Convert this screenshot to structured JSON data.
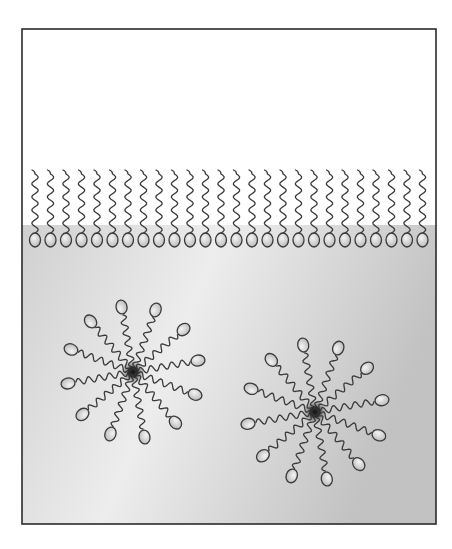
{
  "diagram": {
    "frame": {
      "x": 22,
      "y": 29,
      "width": 414,
      "height": 495,
      "stroke": "#2b2b2b"
    },
    "regions": {
      "air": {
        "label": "air",
        "y_top": 29,
        "y_bottom": 225,
        "color": "#ffffff"
      },
      "water": {
        "label": "water",
        "y_top": 225,
        "y_bottom": 524,
        "color_light": "#ececec",
        "color_dark": "#c4c4c4"
      }
    },
    "monolayer": {
      "label": "surfactant monolayer",
      "count": 26,
      "x_start": 35,
      "spacing": 15.5,
      "tail_top_y": 174,
      "head_center_y": 240,
      "head_rx": 5.5,
      "head_ry": 7,
      "orientation": "heads-down-in-water, tails-up-in-air"
    },
    "micelles": [
      {
        "label": "micelle 1",
        "center": [
          133,
          372
        ],
        "molecule_count": 12,
        "radius": 66,
        "core_color": "#1a1a1a"
      },
      {
        "label": "micelle 2",
        "center": [
          315,
          412
        ],
        "molecule_count": 12,
        "radius": 68,
        "core_color": "#1a1a1a"
      }
    ],
    "colors": {
      "line": "#3a3a3a",
      "head_fill_light": "#f2f2f2",
      "head_fill_dark": "#b8b8b8"
    }
  }
}
